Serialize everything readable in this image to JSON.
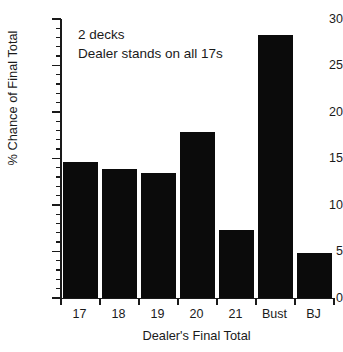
{
  "chart_data": {
    "type": "bar",
    "title": "",
    "subtitle": "",
    "xlabel": "Dealer's Final Total",
    "ylabel": "% Chance of Final Total",
    "categories": [
      "17",
      "18",
      "19",
      "20",
      "21",
      "Bust",
      "BJ"
    ],
    "values": [
      14.6,
      13.9,
      13.4,
      17.8,
      7.3,
      28.3,
      4.8
    ],
    "ylim": [
      0,
      30
    ],
    "xlim": [
      0,
      7
    ],
    "ytick_major": [
      0,
      5,
      10,
      15,
      20,
      25,
      30
    ],
    "ytick_major_labels": [
      "0",
      "5",
      "10",
      "15",
      "20",
      "25",
      "30"
    ],
    "ytick_minor_step": 1,
    "grid": false,
    "legend": false,
    "legend_position": "none",
    "bar_color": "#0b0b0b",
    "axis_color": "#1a1a1a",
    "background": "#ffffff",
    "annotations": [
      "2 decks",
      "Dealer stands on all 17s"
    ]
  },
  "colors": {
    "bar": "#0b0b0b",
    "axis": "#1a1a1a",
    "background": "#ffffff"
  }
}
